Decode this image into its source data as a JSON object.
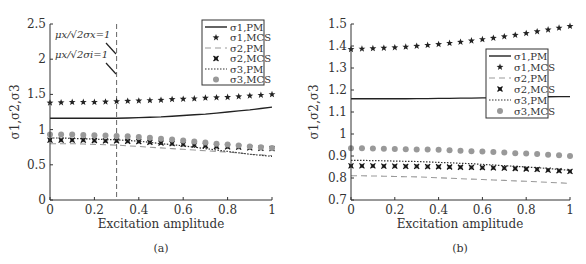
{
  "chart_data": [
    {
      "panel": "a",
      "type": "line",
      "caption": "(a)",
      "xlabel": "Excitation amplitude",
      "ylabel": "σ1,σ2,σ3",
      "xlim": [
        0,
        1
      ],
      "ylim": [
        0,
        2.5
      ],
      "xticks": [
        "0",
        "0.2",
        "0.4",
        "0.6",
        "0.8",
        "1"
      ],
      "yticks": [
        "0",
        "0.5",
        "1",
        "1.5",
        "2",
        "2.5"
      ],
      "grid": false,
      "legend_position": "upper right",
      "annotations": [
        "μx/√2σx=1",
        "μx/√2σi=1"
      ],
      "vline_x": 0.3,
      "x": [
        0,
        0.05,
        0.1,
        0.15,
        0.2,
        0.25,
        0.3,
        0.35,
        0.4,
        0.45,
        0.5,
        0.55,
        0.6,
        0.65,
        0.7,
        0.75,
        0.8,
        0.85,
        0.9,
        0.95,
        1.0
      ],
      "series": [
        {
          "name": "σ1,PM",
          "style": "solid",
          "values": [
            1.16,
            1.16,
            1.16,
            1.16,
            1.16,
            1.16,
            1.16,
            1.165,
            1.17,
            1.175,
            1.18,
            1.19,
            1.2,
            1.21,
            1.22,
            1.235,
            1.25,
            1.265,
            1.28,
            1.3,
            1.32
          ]
        },
        {
          "name": "σ1,MCS",
          "style": "star",
          "values": [
            1.38,
            1.385,
            1.39,
            1.39,
            1.39,
            1.395,
            1.4,
            1.405,
            1.41,
            1.415,
            1.42,
            1.43,
            1.435,
            1.44,
            1.45,
            1.455,
            1.46,
            1.47,
            1.48,
            1.49,
            1.5
          ]
        },
        {
          "name": "σ2,PM",
          "style": "dashed",
          "values": [
            0.8,
            0.8,
            0.8,
            0.795,
            0.79,
            0.785,
            0.78,
            0.77,
            0.76,
            0.75,
            0.74,
            0.73,
            0.72,
            0.71,
            0.7,
            0.69,
            0.68,
            0.67,
            0.65,
            0.64,
            0.63
          ]
        },
        {
          "name": "σ2,MCS",
          "style": "x",
          "values": [
            0.85,
            0.85,
            0.85,
            0.85,
            0.845,
            0.84,
            0.84,
            0.835,
            0.83,
            0.82,
            0.81,
            0.8,
            0.79,
            0.78,
            0.77,
            0.76,
            0.755,
            0.75,
            0.74,
            0.735,
            0.73
          ]
        },
        {
          "name": "σ3,PM",
          "style": "dotted",
          "values": [
            0.88,
            0.88,
            0.875,
            0.87,
            0.865,
            0.86,
            0.855,
            0.845,
            0.835,
            0.82,
            0.8,
            0.785,
            0.77,
            0.75,
            0.73,
            0.71,
            0.69,
            0.67,
            0.65,
            0.635,
            0.62
          ]
        },
        {
          "name": "σ3,MCS",
          "style": "circle",
          "values": [
            0.93,
            0.93,
            0.93,
            0.925,
            0.92,
            0.915,
            0.91,
            0.905,
            0.895,
            0.885,
            0.87,
            0.86,
            0.845,
            0.83,
            0.815,
            0.8,
            0.79,
            0.775,
            0.76,
            0.75,
            0.74
          ]
        }
      ]
    },
    {
      "panel": "b",
      "type": "line",
      "caption": "(b)",
      "xlabel": "Excitation amplitude",
      "ylabel": "σ1,σ2,σ3",
      "xlim": [
        0,
        1
      ],
      "ylim": [
        0.7,
        1.5
      ],
      "xticks": [
        "0",
        "0.2",
        "0.4",
        "0.6",
        "0.8",
        "1"
      ],
      "yticks": [
        "0.7",
        "0.8",
        "0.9",
        "1",
        "1.1",
        "1.2",
        "1.3",
        "1.4",
        "1.5"
      ],
      "grid": false,
      "legend_position": "center right",
      "x": [
        0,
        0.05,
        0.1,
        0.15,
        0.2,
        0.25,
        0.3,
        0.35,
        0.4,
        0.45,
        0.5,
        0.55,
        0.6,
        0.65,
        0.7,
        0.75,
        0.8,
        0.85,
        0.9,
        0.95,
        1.0
      ],
      "series": [
        {
          "name": "σ1,PM",
          "style": "solid",
          "values": [
            1.16,
            1.16,
            1.16,
            1.16,
            1.16,
            1.16,
            1.161,
            1.161,
            1.162,
            1.162,
            1.163,
            1.163,
            1.164,
            1.164,
            1.165,
            1.166,
            1.167,
            1.168,
            1.169,
            1.17,
            1.17
          ]
        },
        {
          "name": "σ1,MCS",
          "style": "star",
          "values": [
            1.385,
            1.387,
            1.389,
            1.391,
            1.393,
            1.396,
            1.4,
            1.404,
            1.408,
            1.413,
            1.418,
            1.424,
            1.43,
            1.436,
            1.443,
            1.45,
            1.458,
            1.466,
            1.474,
            1.482,
            1.49
          ]
        },
        {
          "name": "σ2,PM",
          "style": "dashed",
          "values": [
            0.81,
            0.81,
            0.809,
            0.808,
            0.807,
            0.806,
            0.805,
            0.803,
            0.801,
            0.799,
            0.797,
            0.795,
            0.793,
            0.791,
            0.789,
            0.787,
            0.785,
            0.783,
            0.78,
            0.778,
            0.775
          ]
        },
        {
          "name": "σ2,MCS",
          "style": "x",
          "values": [
            0.855,
            0.855,
            0.855,
            0.854,
            0.854,
            0.853,
            0.853,
            0.852,
            0.851,
            0.85,
            0.849,
            0.848,
            0.847,
            0.846,
            0.845,
            0.843,
            0.841,
            0.839,
            0.836,
            0.833,
            0.83
          ]
        },
        {
          "name": "σ3,PM",
          "style": "dotted",
          "values": [
            0.88,
            0.88,
            0.879,
            0.878,
            0.877,
            0.876,
            0.875,
            0.873,
            0.871,
            0.869,
            0.867,
            0.865,
            0.862,
            0.859,
            0.856,
            0.853,
            0.85,
            0.847,
            0.843,
            0.839,
            0.835
          ]
        },
        {
          "name": "σ3,MCS",
          "style": "circle",
          "values": [
            0.935,
            0.935,
            0.934,
            0.933,
            0.932,
            0.931,
            0.93,
            0.929,
            0.928,
            0.926,
            0.924,
            0.922,
            0.92,
            0.918,
            0.916,
            0.913,
            0.911,
            0.909,
            0.906,
            0.903,
            0.9
          ]
        }
      ]
    }
  ],
  "labels": {
    "a": {
      "caption": "(a)",
      "xlabel": "Excitation amplitude",
      "ylabel": "σ1,σ2,σ3",
      "ann1": "μx/√2σx=1",
      "ann2": "μx/√2σi=1"
    },
    "b": {
      "caption": "(b)",
      "xlabel": "Excitation amplitude",
      "ylabel": "σ1,σ2,σ3"
    },
    "legend": [
      "σ1,PM",
      "σ1,MCS",
      "σ2,PM",
      "σ2,MCS",
      "σ3,PM",
      "σ3,MCS"
    ]
  }
}
